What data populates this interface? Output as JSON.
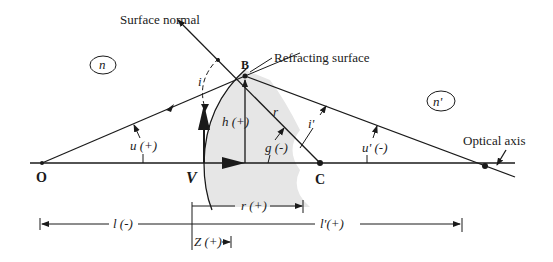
{
  "figure": {
    "type": "refraction-at-spherical-surface",
    "labels": {
      "surface_normal": "Surface normal",
      "refracting_surface": "Refracting surface",
      "optical_axis": "Optical axis",
      "medium_left": "n",
      "medium_right": "n'",
      "incidence_angle": "i",
      "refraction_angle": "i'",
      "ray_height": "h (+)",
      "radius_ray": "r",
      "angle_u": "u (+)",
      "angle_u_prime": "u' (-)",
      "angle_g": "g (-)",
      "point_object": "O",
      "point_vertex": "V",
      "point_B": "B",
      "point_center": "C",
      "dim_r": "r (+)",
      "dim_l": "l (-)",
      "dim_l_prime": "l'(+)",
      "dim_z": "Z (+)"
    },
    "colors": {
      "ink": "#1a1a1a",
      "glass_fill": "#e6e6e6",
      "background": "#ffffff"
    }
  }
}
